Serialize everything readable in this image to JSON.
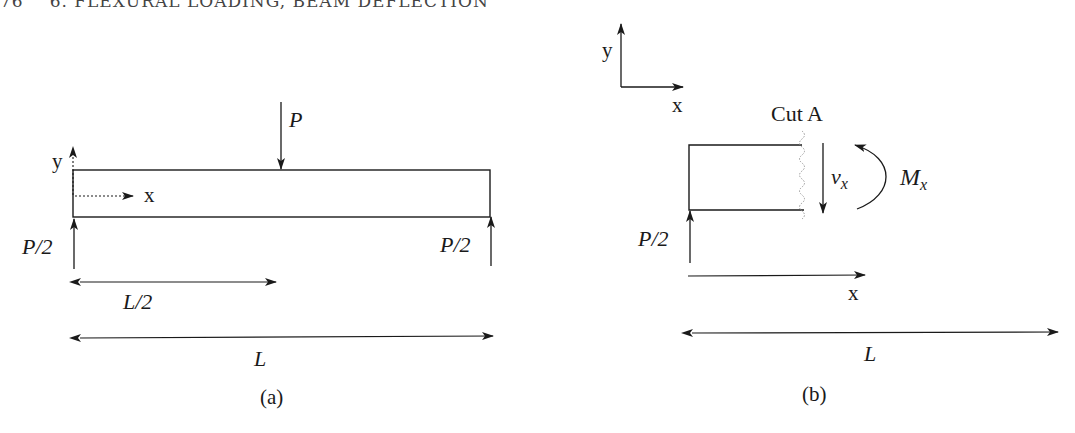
{
  "header": {
    "page_number": "76",
    "chapter_title": "6. FLEXURAL LOADING, BEAM DEFLECTION"
  },
  "figure_a": {
    "caption": "(a)",
    "load_label": "P",
    "left_reaction_label": "P/2",
    "right_reaction_label": "P/2",
    "axis_y_label": "y",
    "axis_x_label": "x",
    "half_span_label": "L/2",
    "span_label": "L"
  },
  "figure_b": {
    "caption": "(b)",
    "cut_label": "Cut A",
    "shear_label": "v",
    "shear_subscript": "x",
    "moment_label": "M",
    "moment_subscript": "x",
    "reaction_label": "P/2",
    "axis_y_label": "y",
    "axis_x_label": "x",
    "position_label": "x",
    "span_label": "L"
  },
  "colors": {
    "line": "#1a1a1a",
    "cut_line": "#999999"
  }
}
